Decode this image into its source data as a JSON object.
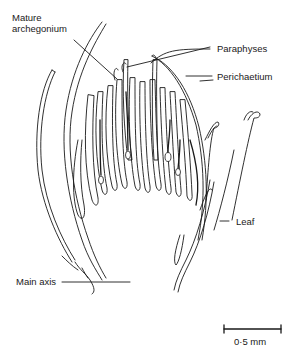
{
  "figure": {
    "type": "botanical-diagram",
    "labels": {
      "mature_archegonium_line1": "Mature",
      "mature_archegonium_line2": "archegonium",
      "paraphyses": "Paraphyses",
      "perichaetium": "Perichaetium",
      "leaf": "Leaf",
      "main_axis": "Main axis"
    },
    "scale_bar": {
      "label": "0·5 mm",
      "value": 0.5,
      "unit": "mm"
    },
    "colors": {
      "ink": "#1a1a1a",
      "background": "#ffffff"
    }
  }
}
